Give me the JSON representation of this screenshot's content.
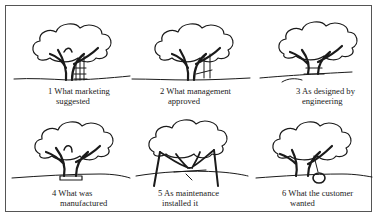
{
  "panels": [
    {
      "number": "1",
      "line1": "1 What marketing",
      "line2": "suggested",
      "depiction": "three-seat swing hanging from trunk"
    },
    {
      "number": "2",
      "line1": "2 What management",
      "line2": "approved",
      "depiction": "swing seat against trunk"
    },
    {
      "number": "3",
      "line1": "3 As designed by",
      "line2": "engineering",
      "depiction": "trunk cut with seat through it"
    },
    {
      "number": "4",
      "line1": "4 What was",
      "line2": "manufactured",
      "depiction": "seat wrapped around trunk"
    },
    {
      "number": "5",
      "line1": "5 As maintenance",
      "line2": "installed it",
      "depiction": "tree propped up by two posts"
    },
    {
      "number": "6",
      "line1": "6 What the customer",
      "line2": "wanted",
      "depiction": "tire swing on branch"
    }
  ],
  "colors": {
    "line": "#1a1a1a",
    "border": "#555555",
    "background": "#ffffff"
  }
}
